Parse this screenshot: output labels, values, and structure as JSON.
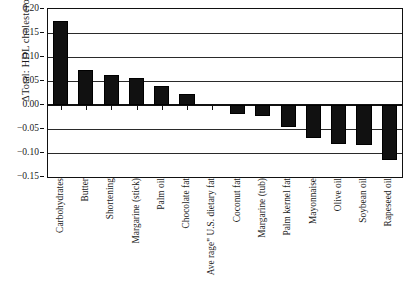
{
  "chart_data": {
    "type": "bar",
    "title": "",
    "subtitle": "",
    "xlabel": "",
    "ylabel": "ΔTotal: HDL cholesterol",
    "ylim": [
      -0.15,
      0.2
    ],
    "ytick_values": [
      0.2,
      0.15,
      0.1,
      0.05,
      0.0,
      -0.05,
      -0.1,
      -0.15
    ],
    "ytick_labels": [
      "0.20",
      "0.15",
      "0.10",
      "0.05",
      "0.00",
      "−0.05",
      "−0.10",
      "−0.15"
    ],
    "grid": true,
    "grid_axis": "y",
    "legend": false,
    "legend_position": "none",
    "bar_color": "#111111",
    "categories": [
      "Carbohydrates",
      "Butter",
      "Shortening",
      "Margarine (stick)",
      "Palm oil",
      "Chocolate fat",
      "Ave rage\" U.S. dietary fat",
      "Coconut fat",
      "Margarine (tub)",
      "Palm kernel fat",
      "Mayonnaise",
      "Olive oil",
      "Soybean oil",
      "Rapeseed oil"
    ],
    "values": [
      0.175,
      0.073,
      0.062,
      0.057,
      0.04,
      0.022,
      0.0,
      -0.018,
      -0.023,
      -0.045,
      -0.068,
      -0.082,
      -0.083,
      -0.115
    ]
  }
}
